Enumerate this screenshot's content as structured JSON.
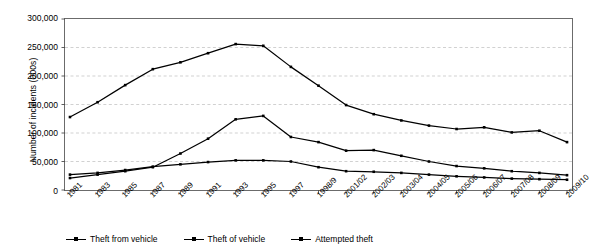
{
  "chart_data": {
    "type": "line",
    "title": "",
    "xlabel": "",
    "ylabel": "Number of incidents (000s)",
    "ylim": [
      0,
      300000
    ],
    "yticks": [
      0,
      50000,
      100000,
      150000,
      200000,
      250000,
      300000
    ],
    "ytick_labels": [
      "0",
      "50,000",
      "100,000",
      "150,000",
      "200,000",
      "250,000",
      "300,000"
    ],
    "grid": true,
    "grid_axis": "y",
    "legend_position": "bottom",
    "categories": [
      "1981",
      "1983",
      "1985",
      "1987",
      "1989",
      "1991",
      "1993",
      "1995",
      "1997",
      "1998/9",
      "2001/02",
      "2002/03",
      "2003/04",
      "2004/05",
      "2005/06",
      "2006/07",
      "2007/08",
      "2008/09",
      "2009/10"
    ],
    "series": [
      {
        "name": "Theft from vehicle",
        "color": "#000000",
        "marker": "square",
        "values": [
          128000,
          154000,
          184000,
          212000,
          224000,
          240000,
          256000,
          253000,
          216000,
          183000,
          149000,
          133000,
          122000,
          113000,
          107000,
          110000,
          101000,
          104000,
          84000
        ]
      },
      {
        "name": "Theft of vehicle",
        "color": "#000000",
        "marker": "square",
        "values": [
          21000,
          27000,
          33000,
          40000,
          64000,
          90000,
          124000,
          130000,
          93000,
          84000,
          69000,
          70000,
          60000,
          50000,
          42000,
          38000,
          33000,
          30000,
          26000
        ]
      },
      {
        "name": "Attempted theft",
        "color": "#000000",
        "marker": "square",
        "values": [
          27000,
          30000,
          35000,
          41000,
          45000,
          49000,
          52000,
          52000,
          50000,
          40000,
          33000,
          32000,
          30000,
          27000,
          24000,
          22000,
          20000,
          19000,
          18000
        ]
      }
    ]
  }
}
